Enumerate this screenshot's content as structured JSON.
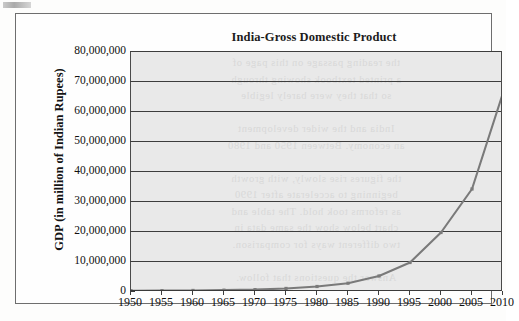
{
  "figure": {
    "title": "India-Gross Domestic Product"
  },
  "chart_data": {
    "type": "line",
    "title": "India-Gross Domestic Product",
    "xlabel": "",
    "ylabel": "GDP (in million of Indian Rupees)",
    "xlim": [
      1950,
      2010
    ],
    "ylim": [
      0,
      80000000
    ],
    "grid": true,
    "legend": false,
    "line_color": "#7a7a7a",
    "plot_background": "#e9e9e9",
    "x_tick_labels": [
      "1950",
      "1955",
      "1960",
      "1965",
      "1970",
      "1975",
      "1980",
      "1985",
      "1990",
      "1995",
      "2000",
      "2005",
      "2010"
    ],
    "y_tick_labels": [
      "0",
      "10,000,000",
      "20,000,000",
      "30,000,000",
      "40,000,000",
      "50,000,000",
      "60,000,000",
      "70,000,000",
      "80,000,000"
    ],
    "y_tick_values": [
      0,
      10000000,
      20000000,
      30000000,
      40000000,
      50000000,
      60000000,
      70000000,
      80000000
    ],
    "x": [
      1950,
      1955,
      1960,
      1965,
      1970,
      1975,
      1980,
      1985,
      1990,
      1995,
      2000,
      2005,
      2010
    ],
    "values": [
      100000,
      120000,
      180000,
      280000,
      450000,
      850000,
      1500000,
      2600000,
      5000000,
      9500000,
      19500000,
      34000000,
      66000000
    ],
    "series": [
      {
        "name": "GDP",
        "values": [
          100000,
          120000,
          180000,
          280000,
          450000,
          850000,
          1500000,
          2600000,
          5000000,
          9500000,
          19500000,
          34000000,
          66000000
        ]
      }
    ]
  },
  "ghost_text": {
    "lines": [
      "the reading passage on this page of",
      "a printed textbook showing through",
      "so that they were barely legible",
      "",
      "India and the wider development",
      "an economy. Between 1950 and 1980",
      "",
      "the figures rise slowly, with growth",
      "beginning to accelerate after 1990",
      "as reforms took hold. The table and",
      "chart below show the same data in",
      "two different ways for comparison.",
      "",
      "Answer the questions that follow."
    ]
  }
}
